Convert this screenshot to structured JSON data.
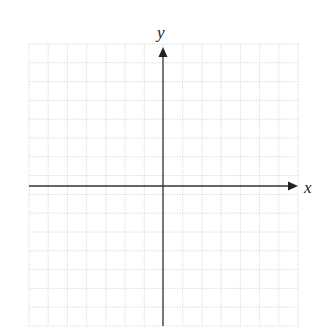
{
  "chart_data": {
    "type": "coordinate-plane",
    "title": "",
    "xlabel": "x",
    "ylabel": "y",
    "grid": true,
    "grid_columns": 14,
    "grid_rows": 15,
    "x_ticks_labeled": false,
    "y_ticks_labeled": false,
    "x_arrow": "positive",
    "y_arrow": "positive",
    "data_points": []
  },
  "colors": {
    "grid": "#d8d8d8",
    "axis": "#333333",
    "label": "#222222",
    "background": "#ffffff"
  },
  "labels": {
    "x_axis": "x",
    "y_axis": "y"
  }
}
